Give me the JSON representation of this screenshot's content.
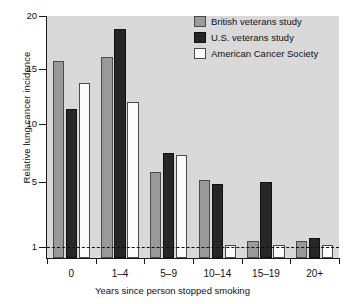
{
  "chart_data": {
    "type": "bar",
    "title": "",
    "xlabel": "Years since person stopped smoking",
    "ylabel": "Relative lung cancer incidence",
    "categories": [
      "0",
      "1–4",
      "5–9",
      "10–14",
      "15–19",
      "20+"
    ],
    "series": [
      {
        "name": "British veterans study",
        "key": "british",
        "color": "#9a9a9a",
        "values": [
          15.8,
          16.1,
          5.9,
          5.2,
          1.4,
          1.35
        ]
      },
      {
        "name": "U.S. veterans study",
        "key": "us",
        "color": "#262626",
        "values": [
          11.4,
          18.8,
          7.5,
          4.9,
          5.0,
          1.55
        ]
      },
      {
        "name": "American Cancer Society",
        "key": "acs",
        "color": "#ffffff",
        "values": [
          13.7,
          12.0,
          7.3,
          1.1,
          1.1,
          1.1
        ]
      }
    ],
    "ytick_labels": [
      "20",
      "15",
      "10",
      "5",
      "1"
    ],
    "ytick_values": [
      20,
      15,
      10,
      5,
      1
    ],
    "ytick_pixels": [
      16,
      69,
      124,
      182,
      247
    ],
    "ylim": [
      0.82,
      20
    ],
    "scale": "log-like",
    "grid": false,
    "legend_position": "top-right",
    "reference_line": {
      "value": 1,
      "style": "dashed",
      "color": "#101010"
    },
    "plot_background": "#d9d9d9",
    "bar_border_color": "#4a4a4a"
  },
  "legend": {
    "items": [
      {
        "label": "British veterans study",
        "key": "british"
      },
      {
        "label": "U.S. veterans study",
        "key": "us"
      },
      {
        "label": "American Cancer Society",
        "key": "acs"
      }
    ]
  }
}
